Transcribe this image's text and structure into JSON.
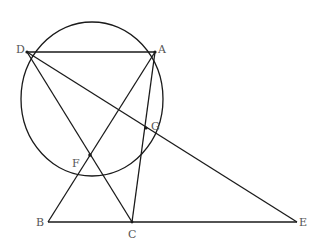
{
  "diagram": {
    "type": "geometry",
    "circle": {
      "cx": 92,
      "cy": 99,
      "rx": 71,
      "ry": 77,
      "through": [
        "D",
        "A",
        "G",
        "F"
      ]
    },
    "points": {
      "D": {
        "label": "D",
        "x": 27,
        "y": 52
      },
      "A": {
        "label": "A",
        "x": 155,
        "y": 52
      },
      "G": {
        "label": "G",
        "x": 146,
        "y": 128
      },
      "F": {
        "label": "F",
        "x": 90,
        "y": 155
      },
      "B": {
        "label": "B",
        "x": 48,
        "y": 222
      },
      "C": {
        "label": "C",
        "x": 132,
        "y": 222
      },
      "E": {
        "label": "E",
        "x": 297,
        "y": 222
      }
    },
    "segments": [
      [
        "D",
        "A"
      ],
      [
        "D",
        "C"
      ],
      [
        "D",
        "E"
      ],
      [
        "A",
        "B"
      ],
      [
        "A",
        "C"
      ],
      [
        "B",
        "E"
      ]
    ]
  }
}
